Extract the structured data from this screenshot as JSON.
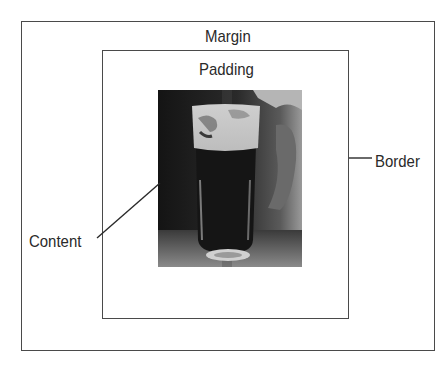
{
  "diagram": {
    "labels": {
      "margin": "Margin",
      "padding": "Padding",
      "border": "Border",
      "content": "Content"
    },
    "content_image": {
      "description": "Black-and-white photo of a pint glass of dark beer with foam head on a table",
      "palette": [
        "#111111",
        "#3a3a3a",
        "#8a8a8a",
        "#d8d8d8"
      ]
    },
    "colors": {
      "line": "#4a4a4a",
      "text": "#2a2a2a",
      "background": "#ffffff"
    }
  }
}
